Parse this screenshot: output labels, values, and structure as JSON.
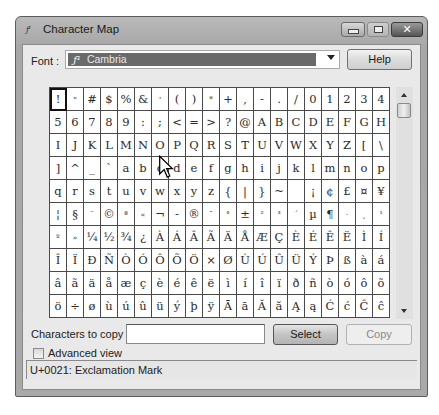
{
  "window": {
    "title": "Character Map",
    "app_icon_glyph": "ƒ¹",
    "controls": {
      "minimize_icon": "minimize-icon",
      "maximize_icon": "maximize-icon",
      "close_icon": "close-icon",
      "close_glyph": "✕"
    }
  },
  "font_row": {
    "label": "Font :",
    "selected_font": "Cambria",
    "font_icon_glyph": "ƒ¹",
    "help_label": "Help"
  },
  "grid": {
    "columns": 20,
    "rows": 10,
    "selected_index": 0,
    "cells": [
      [
        "!",
        "\"",
        "#",
        "$",
        "%",
        "&",
        "'",
        "(",
        ")",
        "*",
        "+",
        ",",
        "-",
        ".",
        "/",
        "0",
        "1",
        "2",
        "3",
        "4"
      ],
      [
        "5",
        "6",
        "7",
        "8",
        "9",
        ":",
        ";",
        "<",
        "=",
        ">",
        "?",
        "@",
        "A",
        "B",
        "C",
        "D",
        "E",
        "F",
        "G",
        "H"
      ],
      [
        "I",
        "J",
        "K",
        "L",
        "M",
        "N",
        "O",
        "P",
        "Q",
        "R",
        "S",
        "T",
        "U",
        "V",
        "W",
        "X",
        "Y",
        "Z",
        "[",
        "\\"
      ],
      [
        "]",
        "^",
        "_",
        "`",
        "a",
        "b",
        "c",
        "d",
        "e",
        "f",
        "g",
        "h",
        "i",
        "j",
        "k",
        "l",
        "m",
        "n",
        "o",
        "p"
      ],
      [
        "q",
        "r",
        "s",
        "t",
        "u",
        "v",
        "w",
        "x",
        "y",
        "z",
        "{",
        "|",
        "}",
        "~",
        " ",
        "¡",
        "¢",
        "£",
        "¤",
        "¥"
      ],
      [
        "¦",
        "§",
        "¨",
        "©",
        "ª",
        "«",
        "¬",
        "-",
        "®",
        "¯",
        "°",
        "±",
        "²",
        "³",
        "´",
        "µ",
        "¶",
        "·",
        "¸",
        "¹"
      ],
      [
        "º",
        "»",
        "¼",
        "½",
        "¾",
        "¿",
        "À",
        "Á",
        "Â",
        "Ã",
        "Ä",
        "Å",
        "Æ",
        "Ç",
        "È",
        "É",
        "Ê",
        "Ë",
        "Ì",
        "Í"
      ],
      [
        "Î",
        "Ï",
        "Ð",
        "Ñ",
        "Ò",
        "Ó",
        "Ô",
        "Õ",
        "Ö",
        "×",
        "Ø",
        "Ù",
        "Ú",
        "Û",
        "Ü",
        "Ý",
        "Þ",
        "ß",
        "à",
        "á"
      ],
      [
        "â",
        "ã",
        "ä",
        "å",
        "æ",
        "ç",
        "è",
        "é",
        "ê",
        "ë",
        "ì",
        "í",
        "î",
        "ï",
        "ð",
        "ñ",
        "ò",
        "ó",
        "ô",
        "õ"
      ],
      [
        "ö",
        "÷",
        "ø",
        "ù",
        "ú",
        "û",
        "ü",
        "ý",
        "þ",
        "ÿ",
        "Ā",
        "ā",
        "Ă",
        "ă",
        "Ą",
        "ą",
        "Ć",
        "ć",
        "Ĉ",
        "ĉ"
      ]
    ]
  },
  "copy_row": {
    "label": "Characters to copy",
    "input_value": "",
    "input_placeholder": "",
    "select_label": "Select",
    "copy_label": "Copy"
  },
  "advanced": {
    "label": "Advanced view",
    "checked": false
  },
  "status": {
    "text": "U+0021: Exclamation Mark"
  },
  "colors": {
    "window_frame": "#a9a9a9",
    "client_bg": "#e9e9e9",
    "font_selection_bg": "#6a6a6a",
    "grid_line": "#4a4a4a"
  }
}
